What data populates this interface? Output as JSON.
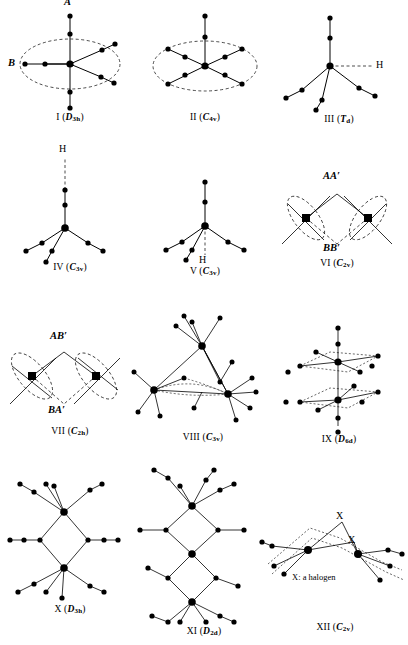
{
  "figure": {
    "background_color": "#ffffff",
    "ink_color": "#000000",
    "note": "X: a halogen",
    "structures": [
      {
        "id": "I",
        "numeral": "I",
        "point_group": "D3h",
        "point_group_letter": "D",
        "point_group_sub": "3h",
        "caption": "I (D3h)",
        "labels": [
          "A",
          "B"
        ],
        "has_dashed_ellipse": true,
        "central_atoms": 1
      },
      {
        "id": "II",
        "numeral": "II",
        "point_group": "C4v",
        "point_group_letter": "C",
        "point_group_sub": "4v",
        "caption": "II (C4v)",
        "labels": [],
        "has_dashed_ellipse": true,
        "central_atoms": 1
      },
      {
        "id": "III",
        "numeral": "III",
        "point_group": "Td",
        "point_group_letter": "T",
        "point_group_sub": "d",
        "caption": "III (Td)",
        "labels": [
          "H"
        ],
        "has_dashed_ellipse": false,
        "central_atoms": 1
      },
      {
        "id": "IV",
        "numeral": "IV",
        "point_group": "C3v",
        "point_group_letter": "C",
        "point_group_sub": "3v",
        "caption": "IV (C3v)",
        "labels": [
          "H"
        ],
        "has_dashed_ellipse": false,
        "central_atoms": 1
      },
      {
        "id": "V",
        "numeral": "V",
        "point_group": "C3v",
        "point_group_letter": "C",
        "point_group_sub": "3v",
        "caption": "V (C3v)",
        "labels": [
          "H"
        ],
        "has_dashed_ellipse": false,
        "central_atoms": 1
      },
      {
        "id": "VI",
        "numeral": "VI",
        "point_group": "C2v",
        "point_group_letter": "C",
        "point_group_sub": "2v",
        "caption": "VI (C2v)",
        "labels": [
          "AA′",
          "BB′"
        ],
        "has_dashed_ellipse": true,
        "central_atoms": 2
      },
      {
        "id": "VII",
        "numeral": "VII",
        "point_group": "C2h",
        "point_group_letter": "C",
        "point_group_sub": "2h",
        "caption": "VII (C2h)",
        "labels": [
          "AB′",
          "BA′"
        ],
        "has_dashed_ellipse": true,
        "central_atoms": 2
      },
      {
        "id": "VIII",
        "numeral": "VIII",
        "point_group": "C3v",
        "point_group_letter": "C",
        "point_group_sub": "3v",
        "caption": "VIII (C3v)",
        "labels": [],
        "has_dashed_ellipse": false,
        "central_atoms": 3
      },
      {
        "id": "IX",
        "numeral": "IX",
        "point_group": "D6d",
        "point_group_letter": "D",
        "point_group_sub": "6d",
        "caption": "IX (D6d)",
        "labels": [],
        "has_dashed_ellipse": false,
        "central_atoms": 2
      },
      {
        "id": "X",
        "numeral": "X",
        "point_group": "D3h",
        "point_group_letter": "D",
        "point_group_sub": "3h",
        "caption": "X (D3h)",
        "labels": [],
        "has_dashed_ellipse": false,
        "central_atoms": 2
      },
      {
        "id": "XI",
        "numeral": "XI",
        "point_group": "D2d",
        "point_group_letter": "D",
        "point_group_sub": "2d",
        "caption": "XI (D2d)",
        "labels": [],
        "has_dashed_ellipse": false,
        "central_atoms": 3
      },
      {
        "id": "XII",
        "numeral": "XII",
        "point_group": "C2v",
        "point_group_letter": "C",
        "point_group_sub": "2v",
        "caption": "XII (C2v)",
        "labels": [
          "X",
          "X"
        ],
        "has_dashed_ellipse": true,
        "central_atoms": 2
      }
    ]
  }
}
